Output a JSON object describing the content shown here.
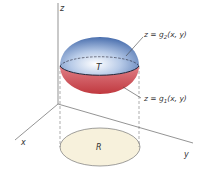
{
  "diagram": {
    "axes": {
      "x": "x",
      "y": "y",
      "z": "z"
    },
    "solid_label": "T",
    "region_label": "R",
    "upper_surface": {
      "prefix": "z = g",
      "sub": "2",
      "suffix": "(x, y)"
    },
    "lower_surface": {
      "prefix": "z = g",
      "sub": "1",
      "suffix": "(x, y)"
    },
    "colors": {
      "upper": "#7a9fd1",
      "lower": "#d9575f",
      "region": "#f7f1dc"
    }
  }
}
